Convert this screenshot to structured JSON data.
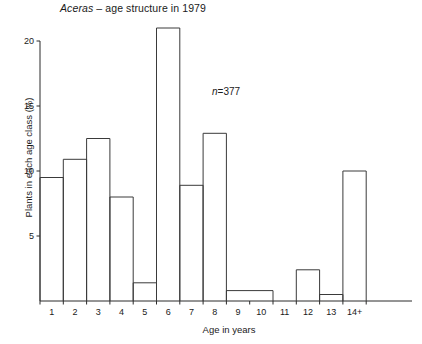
{
  "chart_data": {
    "type": "bar",
    "title": "Aceras – age structure in 1979",
    "title_species": "Aceras",
    "title_rest": " – age structure in 1979",
    "xlabel": "Age in years",
    "ylabel": "Plants in each age class (%)",
    "annotation": "n=377",
    "annotation_symbol": "n",
    "annotation_value": "=377",
    "sample_size": 377,
    "grid": false,
    "legend": null,
    "ylim": [
      0,
      21.5
    ],
    "yticks": [
      5,
      10,
      15,
      20
    ],
    "ytick_labels": [
      "5",
      "10",
      "15",
      "20"
    ],
    "categories": [
      "1",
      "2",
      "3",
      "4",
      "5",
      "6",
      "7",
      "8",
      "9",
      "10",
      "11",
      "12",
      "13",
      "14+"
    ],
    "xtick_labels": [
      "1",
      "2",
      "3",
      "4",
      "5",
      "6",
      "7",
      "8",
      "9",
      "10",
      "11",
      "12",
      "13",
      "14+"
    ],
    "values": [
      9.5,
      10.9,
      12.5,
      8.0,
      1.4,
      21.0,
      8.9,
      12.9,
      0.8,
      0.8,
      0.0,
      2.4,
      0.5,
      10.0
    ],
    "bars": [
      {
        "category": "1",
        "value": 9.5,
        "span": 1
      },
      {
        "category": "2",
        "value": 10.9,
        "span": 1
      },
      {
        "category": "3",
        "value": 12.5,
        "span": 1
      },
      {
        "category": "4",
        "value": 8.0,
        "span": 1
      },
      {
        "category": "5",
        "value": 1.4,
        "span": 1
      },
      {
        "category": "6",
        "value": 21.0,
        "span": 1
      },
      {
        "category": "7",
        "value": 8.9,
        "span": 1
      },
      {
        "category": "8",
        "value": 12.9,
        "span": 1
      },
      {
        "category": "9",
        "value": 0.8,
        "span": 2
      },
      {
        "category": "11",
        "value": 0.0,
        "span": 1
      },
      {
        "category": "12",
        "value": 2.4,
        "span": 1
      },
      {
        "category": "13",
        "value": 0.5,
        "span": 1
      },
      {
        "category": "14+",
        "value": 10.0,
        "span": 1
      }
    ],
    "colors": {
      "bar_stroke": "#3a3a3a",
      "bar_fill": "none",
      "axis": "#2a2a2a",
      "text": "#1a1a1a",
      "background": "#ffffff"
    }
  }
}
